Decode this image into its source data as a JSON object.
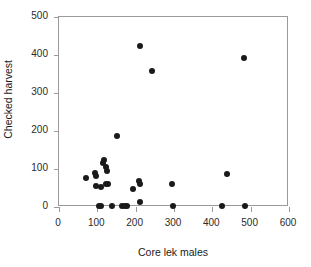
{
  "chart_data": {
    "type": "scatter",
    "title": "",
    "xlabel": "Core lek males",
    "ylabel": "Checked harvest",
    "xlim": [
      0,
      600
    ],
    "ylim": [
      0,
      500
    ],
    "xticks": [
      0,
      100,
      200,
      300,
      400,
      500,
      600
    ],
    "yticks": [
      0,
      100,
      200,
      300,
      400,
      500
    ],
    "xtick_labels": [
      "0",
      "100",
      "200",
      "300",
      "400",
      "500",
      "600"
    ],
    "ytick_labels": [
      "0",
      "100",
      "200",
      "300",
      "400",
      "500"
    ],
    "grid": false,
    "legend": null,
    "marker": "filled-circle",
    "marker_color": "#1a1a1a",
    "points": [
      {
        "x": 74,
        "y": 73
      },
      {
        "x": 97,
        "y": 88
      },
      {
        "x": 99,
        "y": 78
      },
      {
        "x": 100,
        "y": 53
      },
      {
        "x": 108,
        "y": 0
      },
      {
        "x": 112,
        "y": 0
      },
      {
        "x": 113,
        "y": 51
      },
      {
        "x": 118,
        "y": 113
      },
      {
        "x": 121,
        "y": 120
      },
      {
        "x": 124,
        "y": 103
      },
      {
        "x": 125,
        "y": 57
      },
      {
        "x": 128,
        "y": 92
      },
      {
        "x": 131,
        "y": 58
      },
      {
        "x": 141,
        "y": 0
      },
      {
        "x": 155,
        "y": 184
      },
      {
        "x": 166,
        "y": 0
      },
      {
        "x": 174,
        "y": 0
      },
      {
        "x": 179,
        "y": 0
      },
      {
        "x": 196,
        "y": 44
      },
      {
        "x": 211,
        "y": 65
      },
      {
        "x": 213,
        "y": 57
      },
      {
        "x": 213,
        "y": 11
      },
      {
        "x": 215,
        "y": 421
      },
      {
        "x": 245,
        "y": 355
      },
      {
        "x": 297,
        "y": 59
      },
      {
        "x": 299,
        "y": 0
      },
      {
        "x": 428,
        "y": 0
      },
      {
        "x": 440,
        "y": 85
      },
      {
        "x": 486,
        "y": 390
      },
      {
        "x": 487,
        "y": 0
      }
    ]
  }
}
